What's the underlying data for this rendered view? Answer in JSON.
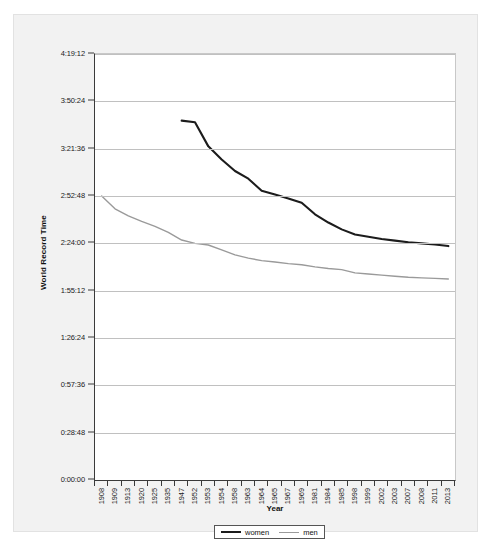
{
  "chart_data": {
    "type": "line",
    "title": "",
    "xlabel": "Year",
    "ylabel": "World Record Time",
    "grid": true,
    "legend_position": "bottom",
    "categories": [
      "1908",
      "1909",
      "1913",
      "1920",
      "1925",
      "1935",
      "1947",
      "1952",
      "1953",
      "1954",
      "1958",
      "1963",
      "1964",
      "1965",
      "1967",
      "1969",
      "1981",
      "1984",
      "1985",
      "1998",
      "1999",
      "2002",
      "2003",
      "2007",
      "2008",
      "2011",
      "2013"
    ],
    "ytick_labels": [
      "0:00:00",
      "0:28:48",
      "0:57:36",
      "1:26:24",
      "1:55:12",
      "2:24:00",
      "2:52:48",
      "3:21:36",
      "3:50:24",
      "4:19:12"
    ],
    "ytick_seconds": [
      0,
      1728,
      3456,
      5184,
      6912,
      8640,
      10368,
      12096,
      13824,
      15552
    ],
    "ylim_seconds": [
      0,
      15552
    ],
    "series": [
      {
        "name": "women",
        "color": "#1c1c1c",
        "values": [
          null,
          null,
          null,
          null,
          null,
          null,
          13120,
          13060,
          12180,
          11700,
          11280,
          11000,
          10560,
          10420,
          10280,
          10120,
          9700,
          9400,
          9150,
          8960,
          8880,
          8800,
          8740,
          8680,
          8640,
          8600,
          8540
        ]
      },
      {
        "name": "men",
        "color": "#9a9a9a",
        "values": [
          10368,
          9900,
          9640,
          9440,
          9260,
          9040,
          8760,
          8640,
          8580,
          8400,
          8220,
          8100,
          8010,
          7960,
          7900,
          7860,
          7780,
          7720,
          7680,
          7560,
          7520,
          7480,
          7440,
          7400,
          7380,
          7360,
          7340
        ]
      }
    ]
  },
  "legend": {
    "items": [
      {
        "label": "women"
      },
      {
        "label": "men"
      }
    ]
  }
}
